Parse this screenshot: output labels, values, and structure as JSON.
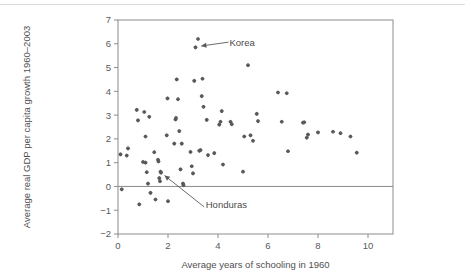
{
  "figure": {
    "background_color": "#ffffff",
    "marker_color": "#595959",
    "axis_color": "#8c8c8c",
    "text_color": "#4a4a4a"
  },
  "chart_data": {
    "type": "scatter",
    "title": "",
    "xlabel": "Average years of schooling in 1960",
    "ylabel": "Average real GDP per capita growth 1960–2003",
    "xlim": [
      0,
      11
    ],
    "ylim": [
      -2,
      7
    ],
    "xticks": [
      0,
      2,
      4,
      6,
      8,
      10
    ],
    "xtick_labels": [
      "0",
      "2",
      "4",
      "6",
      "8",
      "10"
    ],
    "yticks": [
      -2,
      -1,
      0,
      1,
      2,
      3,
      4,
      5,
      6,
      7
    ],
    "ytick_labels": [
      "−2",
      "−1",
      "0",
      "1",
      "2",
      "3",
      "4",
      "5",
      "6",
      "7"
    ],
    "grid": false,
    "legend": null,
    "zero_reference_line": 0,
    "points": [
      [
        0.1,
        1.35
      ],
      [
        0.15,
        -0.12
      ],
      [
        0.35,
        1.3
      ],
      [
        0.4,
        1.6
      ],
      [
        0.75,
        3.22
      ],
      [
        0.8,
        2.78
      ],
      [
        0.85,
        -0.75
      ],
      [
        1.0,
        1.03
      ],
      [
        1.05,
        3.13
      ],
      [
        1.1,
        2.1
      ],
      [
        1.1,
        1.0
      ],
      [
        1.15,
        0.6
      ],
      [
        1.2,
        0.12
      ],
      [
        1.25,
        2.93
      ],
      [
        1.3,
        -0.27
      ],
      [
        1.45,
        1.44
      ],
      [
        1.5,
        -0.55
      ],
      [
        1.6,
        1.12
      ],
      [
        1.62,
        1.05
      ],
      [
        1.65,
        0.35
      ],
      [
        1.68,
        0.22
      ],
      [
        1.7,
        0.62
      ],
      [
        1.72,
        0.58
      ],
      [
        1.95,
        2.15
      ],
      [
        1.98,
        3.7
      ],
      [
        2.0,
        -0.62
      ],
      [
        2.25,
        1.8
      ],
      [
        2.3,
        2.82
      ],
      [
        2.32,
        2.88
      ],
      [
        2.35,
        4.5
      ],
      [
        2.4,
        3.67
      ],
      [
        2.45,
        2.33
      ],
      [
        2.5,
        0.72
      ],
      [
        2.55,
        1.8
      ],
      [
        2.6,
        0.12
      ],
      [
        2.62,
        0.05
      ],
      [
        2.9,
        1.45
      ],
      [
        2.95,
        0.85
      ],
      [
        3.0,
        0.55
      ],
      [
        3.05,
        4.44
      ],
      [
        3.1,
        5.85
      ],
      [
        3.2,
        6.2
      ],
      [
        3.25,
        1.5
      ],
      [
        3.3,
        1.53
      ],
      [
        3.35,
        3.8
      ],
      [
        3.38,
        4.53
      ],
      [
        3.42,
        3.35
      ],
      [
        3.55,
        2.8
      ],
      [
        3.6,
        1.32
      ],
      [
        3.85,
        1.4
      ],
      [
        4.05,
        2.6
      ],
      [
        4.1,
        2.72
      ],
      [
        4.15,
        3.17
      ],
      [
        4.2,
        0.92
      ],
      [
        4.5,
        2.72
      ],
      [
        4.55,
        2.62
      ],
      [
        5.0,
        0.62
      ],
      [
        5.05,
        2.1
      ],
      [
        5.2,
        5.1
      ],
      [
        5.3,
        2.15
      ],
      [
        5.4,
        1.92
      ],
      [
        5.55,
        3.05
      ],
      [
        5.6,
        2.75
      ],
      [
        6.4,
        3.95
      ],
      [
        6.55,
        2.72
      ],
      [
        6.75,
        3.92
      ],
      [
        6.8,
        1.48
      ],
      [
        7.4,
        2.68
      ],
      [
        7.45,
        2.7
      ],
      [
        7.55,
        2.05
      ],
      [
        7.6,
        2.18
      ],
      [
        8.0,
        2.27
      ],
      [
        8.6,
        2.3
      ],
      [
        8.9,
        2.24
      ],
      [
        9.3,
        2.1
      ],
      [
        9.55,
        1.42
      ]
    ],
    "annotations": [
      {
        "label": "Korea",
        "label_x": 4.3,
        "label_y": 6.05,
        "target_x": 3.15,
        "target_y": 5.88
      },
      {
        "label": "Honduras",
        "label_x": 3.35,
        "label_y": -0.78,
        "target_x": 1.72,
        "target_y": 0.58
      }
    ]
  }
}
